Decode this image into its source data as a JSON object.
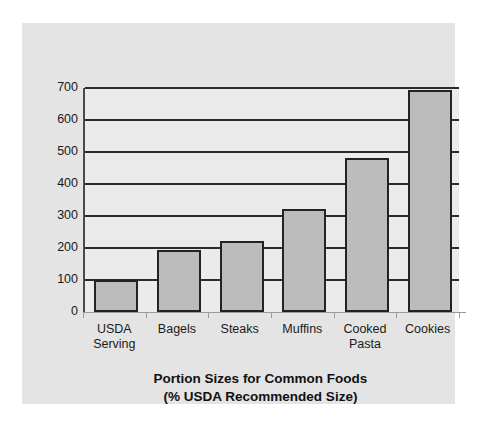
{
  "chart_data": {
    "type": "bar",
    "title": "Portion Sizes for Common Foods",
    "subtitle": "(% USDA Recommended Size)",
    "xlabel": "",
    "ylabel": "",
    "ylim": [
      0,
      700
    ],
    "ytick_step": 100,
    "yticks": [
      0,
      100,
      200,
      300,
      400,
      500,
      600,
      700
    ],
    "grid": true,
    "legend": false,
    "units": "% USDA Recommended Size",
    "categories": [
      "USDA\nServing",
      "Bagels",
      "Steaks",
      "Muffins",
      "Cooked\nPasta",
      "Cookies"
    ],
    "values": [
      100,
      195,
      222,
      322,
      480,
      695
    ],
    "bar_fill_color": "#bcbcbc",
    "bar_edge_color": "#232323",
    "plot_background_color": "#ebebeb",
    "panel_background_color": "#e4e4e4",
    "gridline_color": "#2b2b2b",
    "axis_color": "#4a4a4a"
  }
}
